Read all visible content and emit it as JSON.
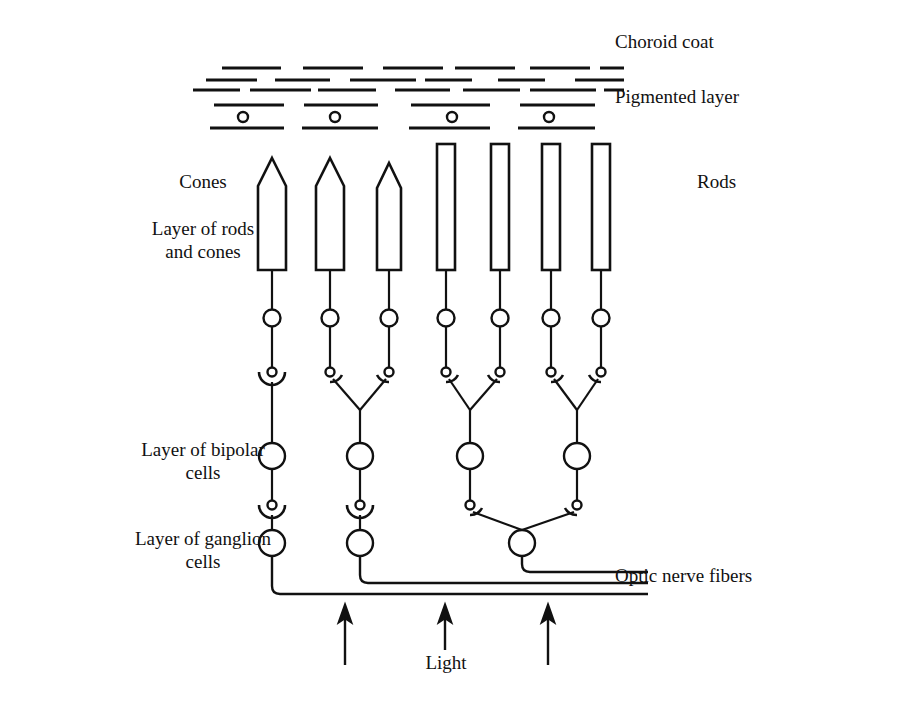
{
  "figure": {
    "background_color": "#ffffff",
    "ink_color": "#111111"
  },
  "labels": {
    "choroid_coat": "Choroid coat",
    "pigmented_layer": "Pigmented layer",
    "rods": "Rods",
    "cones": "Cones",
    "layer_rods_cones_line1": "Layer of rods",
    "layer_rods_cones_line2": "and cones",
    "layer_bipolar_line1": "Layer of bipolar",
    "layer_bipolar_line2": "cells",
    "layer_ganglion_line1": "Layer of ganglion",
    "layer_ganglion_line2": "cells",
    "optic_nerve_fibers": "Optic nerve fibers",
    "light": "Light"
  },
  "structure": {
    "cone_count": 3,
    "rod_count": 4,
    "bipolar_cell_count": 4,
    "ganglion_cell_count": 3,
    "pigment_cell_count": 4,
    "optic_nerve_fiber_count": 3,
    "light_arrow_count": 3
  },
  "geometry": {
    "cone_x": [
      272,
      330,
      389
    ],
    "rod_x": [
      446,
      500,
      551,
      601
    ],
    "photoreceptor_top_cone": 158,
    "photoreceptor_top_rod": 144,
    "photoreceptor_bottom": 270,
    "cone_shoulder_y": 186,
    "cell_body_half_width": 14,
    "rod_half_width": 9,
    "nucleus_y": 318,
    "nucleus_r": 8.5,
    "terminal_y": 372,
    "terminal_r": 4.5,
    "bipolar_y": 456,
    "bipolar_r": 13,
    "bipolar_terminal_y": 505,
    "ganglion_y": 543,
    "ganglion_r": 13,
    "bipolar_x": [
      272,
      360,
      470,
      577
    ],
    "ganglion_x": [
      272,
      360,
      522
    ],
    "axon_turn_y": [
      594,
      583,
      572
    ],
    "nerve_end_x": 648,
    "pigment_cell_x": [
      232,
      340,
      452,
      560
    ],
    "pigment_row_y": 104,
    "pigment_top_line_y": 97,
    "pigment_bottom_line_y": 122,
    "choroid_rows_y": [
      68,
      80,
      90
    ],
    "light_arrow_x": [
      345,
      445,
      548
    ],
    "light_arrow_top_y": 607,
    "light_arrow_bottom_y": 665
  },
  "label_positions": {
    "choroid_coat": {
      "x": 615,
      "y": 48
    },
    "pigmented_layer": {
      "x": 615,
      "y": 103
    },
    "rods": {
      "x": 697,
      "y": 188
    },
    "cones": {
      "x": 203,
      "y": 188
    },
    "layer_rods_cones": {
      "x": 203,
      "y": 235
    },
    "layer_bipolar": {
      "x": 203,
      "y": 456
    },
    "layer_ganglion": {
      "x": 203,
      "y": 545
    },
    "optic_nerve_fibers": {
      "x": 615,
      "y": 582
    },
    "light": {
      "x": 446,
      "y": 662
    }
  }
}
